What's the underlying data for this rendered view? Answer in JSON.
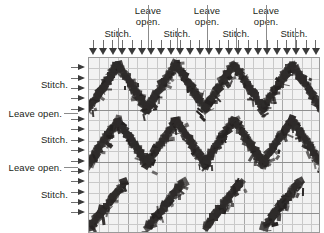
{
  "diagram": {
    "type": "knitting-stitch-chart",
    "background_color": "#ffffff",
    "panel_color": "#f2f2f2",
    "grid_color": "#c9c9c9",
    "motif_color": "#2e2b2a",
    "label_color": "#231f20",
    "arrow_color": "#3a3a3a"
  },
  "top_labels": [
    {
      "id": "t-stitch-1",
      "text": "Stitch.",
      "lines": [
        "Stitch."
      ]
    },
    {
      "id": "t-leaveopen-1",
      "text": "Leave open.",
      "lines": [
        "Leave",
        "open."
      ]
    },
    {
      "id": "t-stitch-2",
      "text": "Stitch.",
      "lines": [
        "Stitch."
      ]
    },
    {
      "id": "t-leaveopen-2",
      "text": "Leave open.",
      "lines": [
        "Leave",
        "open."
      ]
    },
    {
      "id": "t-stitch-3",
      "text": "Stitch.",
      "lines": [
        "Stitch."
      ]
    },
    {
      "id": "t-leaveopen-3",
      "text": "Leave open.",
      "lines": [
        "Leave",
        "open."
      ]
    },
    {
      "id": "t-stitch-4",
      "text": "Stitch.",
      "lines": [
        "Stitch."
      ]
    }
  ],
  "top_label_text": {
    "stitch": "Stitch.",
    "leave_line1": "Leave",
    "leave_line2": "open."
  },
  "left_labels": [
    {
      "id": "l-stitch-1",
      "text": "Stitch."
    },
    {
      "id": "l-leaveopen-1",
      "text": "Leave open."
    },
    {
      "id": "l-stitch-2",
      "text": "Stitch."
    },
    {
      "id": "l-leaveopen-2",
      "text": "Leave open."
    },
    {
      "id": "l-stitch-3",
      "text": "Stitch."
    }
  ],
  "left_label_text": {
    "stitch": "Stitch.",
    "leave_open": "Leave open."
  },
  "arrows": {
    "top_count": 24,
    "left_count": 15,
    "top_direction": "down",
    "left_direction": "right"
  },
  "grid": {
    "columns": 24,
    "rows": 17,
    "cell_width": 9.6,
    "cell_height": 10.2
  },
  "motif": {
    "description": "dark chevron zigzag stitch bands",
    "band_count": 3,
    "repeats_per_band": 4,
    "band_styles": [
      "chevron",
      "chevron",
      "diagonal"
    ]
  }
}
